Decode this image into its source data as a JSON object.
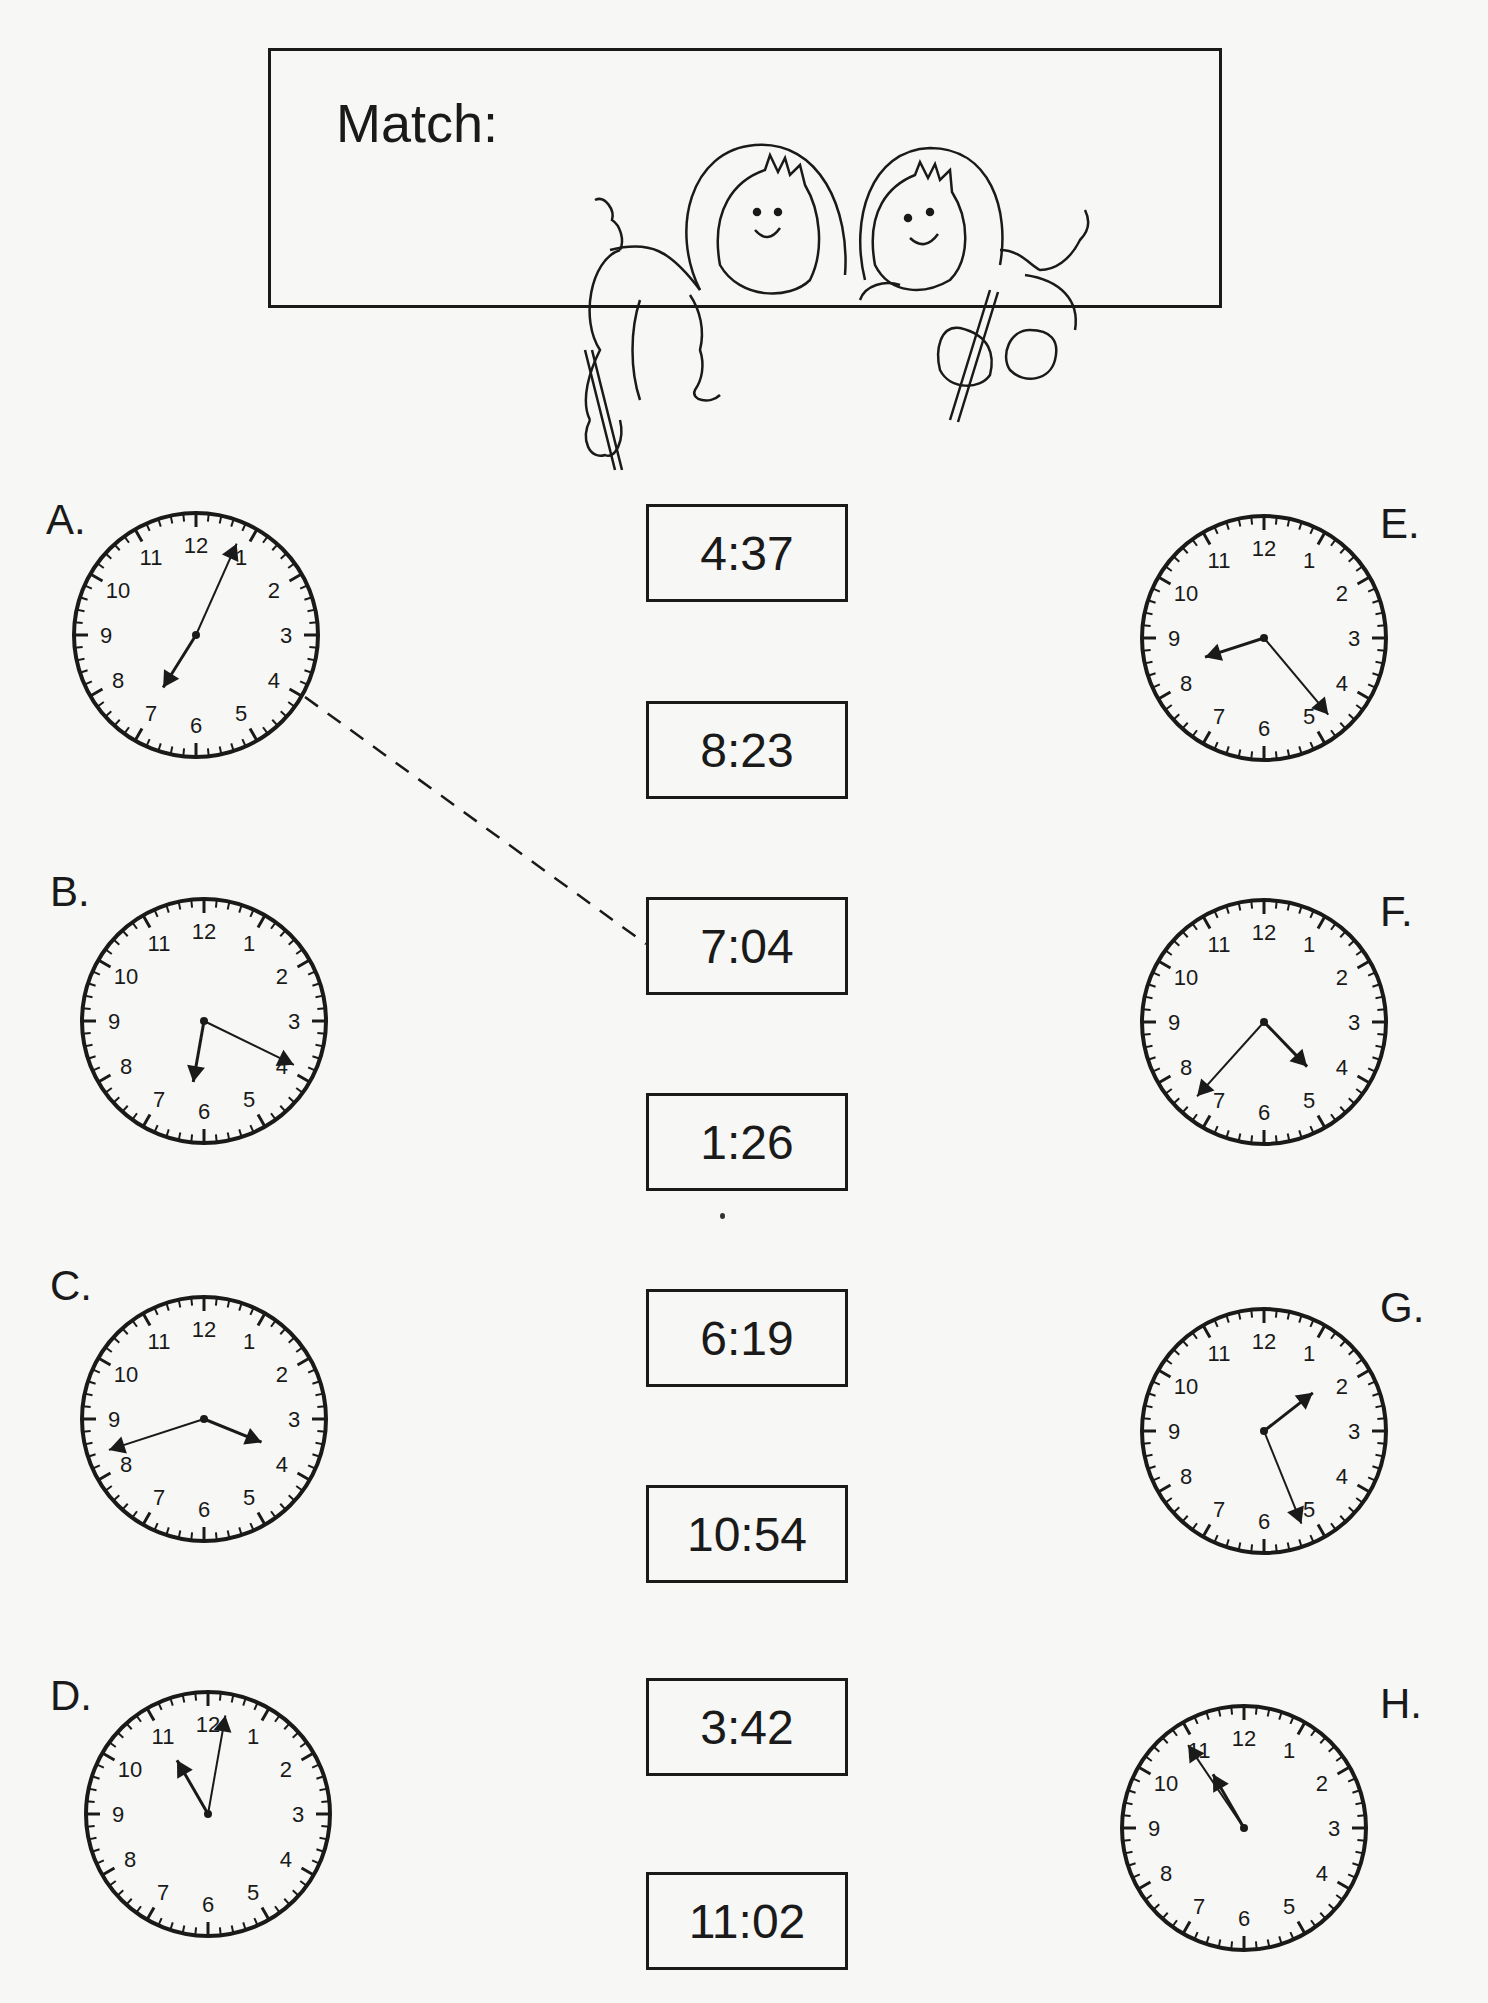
{
  "worksheet": {
    "title": "Match:",
    "illustration": "two-children-with-pencils"
  },
  "clocks": [
    {
      "label": "A.",
      "hour_hand_deg": 212,
      "minute_hand_deg": 24,
      "matched_to": "7:04"
    },
    {
      "label": "B.",
      "hour_hand_deg": 190,
      "minute_hand_deg": 116
    },
    {
      "label": "C.",
      "hour_hand_deg": 112,
      "minute_hand_deg": 252
    },
    {
      "label": "D.",
      "hour_hand_deg": 330,
      "minute_hand_deg": 10
    },
    {
      "label": "E.",
      "hour_hand_deg": 252,
      "minute_hand_deg": 140
    },
    {
      "label": "F.",
      "hour_hand_deg": 136,
      "minute_hand_deg": 222
    },
    {
      "label": "G.",
      "hour_hand_deg": 52,
      "minute_hand_deg": 158
    },
    {
      "label": "H.",
      "hour_hand_deg": 330,
      "minute_hand_deg": 326
    }
  ],
  "times": [
    "4:37",
    "8:23",
    "7:04",
    "1:26",
    "6:19",
    "10:54",
    "3:42",
    "11:02"
  ],
  "colors": {
    "ink": "#1a1a1a",
    "paper": "#f7f7f5"
  }
}
